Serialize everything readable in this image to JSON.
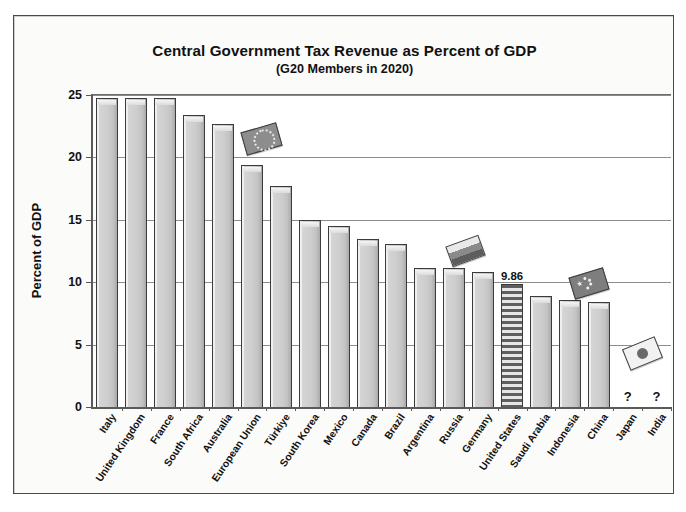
{
  "chart_data": {
    "type": "bar",
    "title": "Central Government Tax Revenue as Percent of GDP",
    "subtitle": "(G20 Members in 2020)",
    "xlabel": "",
    "ylabel": "Percent of GDP",
    "ylim": [
      0,
      25
    ],
    "ytick_labels": [
      "0",
      "5",
      "10",
      "15",
      "20",
      "25"
    ],
    "ytick_values": [
      0,
      5,
      10,
      15,
      20,
      25
    ],
    "grid": true,
    "legend": "none",
    "categories": [
      "Italy",
      "United Kingdom",
      "France",
      "South Africa",
      "Australia",
      "European Union",
      "Türkiye",
      "South Korea",
      "Mexico",
      "Canada",
      "Brazil",
      "Argentina",
      "Russia",
      "Germany",
      "United States",
      "Saudi Arabia",
      "Indonesia",
      "China",
      "Japan",
      "India"
    ],
    "values": [
      24.8,
      24.8,
      24.8,
      23.4,
      22.7,
      19.4,
      17.7,
      15.0,
      14.5,
      13.5,
      13.1,
      11.1,
      11.1,
      10.8,
      9.86,
      8.9,
      8.6,
      8.4,
      null,
      null
    ],
    "bars": [
      {
        "label": "Italy",
        "value": 24.8,
        "value_label": "",
        "style": "plain",
        "note": ""
      },
      {
        "label": "United Kingdom",
        "value": 24.8,
        "value_label": "",
        "style": "plain",
        "note": ""
      },
      {
        "label": "France",
        "value": 24.8,
        "value_label": "",
        "style": "plain",
        "note": ""
      },
      {
        "label": "South Africa",
        "value": 23.4,
        "value_label": "",
        "style": "plain",
        "note": ""
      },
      {
        "label": "Australia",
        "value": 22.7,
        "value_label": "",
        "style": "plain",
        "note": ""
      },
      {
        "label": "European Union",
        "value": 19.4,
        "value_label": "",
        "style": "plain",
        "note": ""
      },
      {
        "label": "Türkiye",
        "value": 17.7,
        "value_label": "",
        "style": "plain",
        "note": ""
      },
      {
        "label": "South Korea",
        "value": 15.0,
        "value_label": "",
        "style": "plain",
        "note": ""
      },
      {
        "label": "Mexico",
        "value": 14.5,
        "value_label": "",
        "style": "plain",
        "note": ""
      },
      {
        "label": "Canada",
        "value": 13.5,
        "value_label": "",
        "style": "plain",
        "note": ""
      },
      {
        "label": "Brazil",
        "value": 13.1,
        "value_label": "",
        "style": "plain",
        "note": ""
      },
      {
        "label": "Argentina",
        "value": 11.1,
        "value_label": "",
        "style": "plain",
        "note": ""
      },
      {
        "label": "Russia",
        "value": 11.1,
        "value_label": "",
        "style": "plain",
        "note": ""
      },
      {
        "label": "Germany",
        "value": 10.8,
        "value_label": "",
        "style": "plain",
        "note": ""
      },
      {
        "label": "United States",
        "value": 9.86,
        "value_label": "9.86",
        "style": "striped",
        "note": "us-flag-stripes"
      },
      {
        "label": "Saudi Arabia",
        "value": 8.9,
        "value_label": "",
        "style": "plain",
        "note": ""
      },
      {
        "label": "Indonesia",
        "value": 8.6,
        "value_label": "",
        "style": "plain",
        "note": ""
      },
      {
        "label": "China",
        "value": 8.4,
        "value_label": "",
        "style": "plain",
        "note": ""
      },
      {
        "label": "Japan",
        "value": null,
        "value_label": "?",
        "style": "missing",
        "note": "no data"
      },
      {
        "label": "India",
        "value": null,
        "value_label": "?",
        "style": "missing",
        "note": "no data"
      }
    ],
    "annotations": [
      {
        "name": "european-union-flag",
        "text": ""
      },
      {
        "name": "russia-flag",
        "text": ""
      },
      {
        "name": "china-flag",
        "text": ""
      },
      {
        "name": "japan-flag",
        "text": ""
      },
      {
        "name": "united-states-value",
        "text": "9.86"
      },
      {
        "name": "japan-missing-value",
        "text": "?"
      },
      {
        "name": "india-missing-value",
        "text": "?"
      }
    ],
    "colors": {
      "bar_fill": "#cdcdcd",
      "bar_outline": "#3b3b3b",
      "bar_highlight": "#efefef",
      "gridline": "#8c8c8c",
      "axis": "#5a5a5a",
      "text": "#111111",
      "plot_background": "#ffffff",
      "page_background": "#fbfbfa"
    }
  }
}
